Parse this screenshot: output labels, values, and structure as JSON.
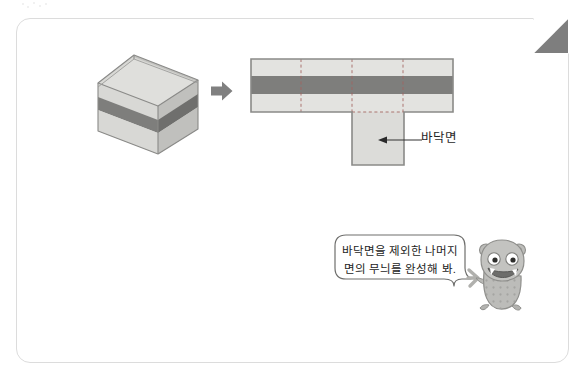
{
  "page": {
    "title": "",
    "frame": {
      "corner_fold": "dog-ear-fold"
    }
  },
  "colors": {
    "band_light": "#e3e3e0",
    "band_dark": "#7e7e7c",
    "band_mid": "#c9c9c6",
    "outline": "#8a8a88",
    "frame_border": "#dcdcdc",
    "arrow": "#808080",
    "text": "#1f1f1f",
    "mascot_body": "#b9b9b6",
    "mascot_mouth": "#6d6d6b",
    "dogear": "#7e7e7e"
  },
  "diagram": {
    "solid": {
      "name": "open-top-striped-box",
      "description": "3D open box with horizontal stripe pattern",
      "faces": [
        "front",
        "right",
        "inner-left",
        "inner-back"
      ],
      "stripes": [
        "light",
        "dark",
        "light"
      ]
    },
    "arrow": {
      "icon": "right-arrow-icon",
      "direction": "right"
    },
    "net": {
      "name": "box-net",
      "shape": "T-shape",
      "side_panels": 4,
      "bottom_panel": 1,
      "band_rows": [
        "light",
        "dark",
        "light"
      ],
      "fold_lines": "dashed"
    },
    "callout": {
      "label": "바닥면",
      "points_to": "bottom-panel",
      "arrowhead": "left"
    }
  },
  "speech": {
    "line1": "바닥면을 제외한 나머지",
    "line2": "면의 무늬를 완성해 봐.",
    "speaker": "mascot-character"
  },
  "icons": {
    "arrow_right": "right-arrow-icon",
    "callout_arrow": "left-arrowhead-icon",
    "mascot": "monster-character-icon",
    "dogear": "page-fold-icon"
  }
}
